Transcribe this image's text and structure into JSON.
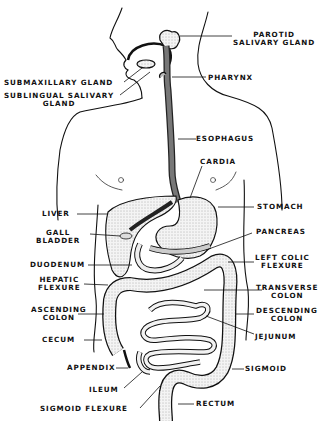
{
  "colors": {
    "ink": "#111111",
    "background": "#ffffff",
    "organ_fill": "#e6e6e6",
    "dark_fill": "#333333"
  },
  "labels": {
    "parotid": [
      "PAROTID",
      "SALIVARY GLAND"
    ],
    "pharynx": "PHARYNX",
    "submaxillary": "SUBMAXILLARY GLAND",
    "sublingual": [
      "SUBLINGUAL SALIVARY",
      "GLAND"
    ],
    "esophagus": "ESOPHAGUS",
    "cardia": "CARDIA",
    "liver": "LIVER",
    "stomach": "STOMACH",
    "gall_bladder": [
      "GALL",
      "BLADDER"
    ],
    "pancreas": "PANCREAS",
    "duodenum": "DUODENUM",
    "left_colic_flexure": [
      "LEFT COLIC",
      "FLEXURE"
    ],
    "hepatic_flexure": [
      "HEPATIC",
      "FLEXURE"
    ],
    "transverse_colon": [
      "TRANSVERSE",
      "COLON"
    ],
    "ascending_colon": [
      "ASCENDING",
      "COLON"
    ],
    "descending_colon": [
      "DESCENDING",
      "COLON"
    ],
    "cecum": "CECUM",
    "jejunum": "JEJUNUM",
    "appendix": "APPENDIX",
    "sigmoid": "SIGMOID",
    "ileum": "ILEUM",
    "sigmoid_flexure": "SIGMOID FLEXURE",
    "rectum": "RECTUM"
  }
}
